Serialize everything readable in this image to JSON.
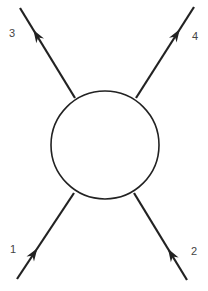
{
  "diagram": {
    "type": "scattering-vertex",
    "colors": {
      "stroke": "#222222",
      "label": "#444444",
      "background": "#ffffff"
    },
    "blob": {
      "shape": "circle",
      "cx": 105,
      "cy": 145,
      "r": 54
    },
    "legs": [
      {
        "id": "1",
        "label": "1",
        "direction": "incoming",
        "from": [
          17,
          279
        ],
        "to": [
          74,
          193
        ],
        "label_pos": [
          10,
          253
        ]
      },
      {
        "id": "2",
        "label": "2",
        "direction": "incoming",
        "from": [
          187,
          280
        ],
        "to": [
          134,
          193
        ],
        "label_pos": [
          191,
          255
        ]
      },
      {
        "id": "3",
        "label": "3",
        "direction": "outgoing",
        "from": [
          75,
          98
        ],
        "to": [
          20,
          8
        ],
        "label_pos": [
          9,
          37
        ]
      },
      {
        "id": "4",
        "label": "4",
        "direction": "outgoing",
        "from": [
          136,
          98
        ],
        "to": [
          194,
          7
        ],
        "label_pos": [
          192,
          40
        ]
      }
    ]
  }
}
